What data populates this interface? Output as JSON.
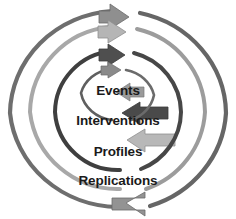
{
  "diagram": {
    "background_color": "#ffffff",
    "rings": [
      {
        "id": "events",
        "label": "Events",
        "level": 1,
        "position": "innermost",
        "arc_color": "#595959",
        "arrow_color": "#8c8c8c",
        "arrow_top_direction": "right",
        "arrow_bottom_direction": "left",
        "radius_x": 36,
        "radius_y": 33
      },
      {
        "id": "interventions",
        "label": "Interventions",
        "level": 2,
        "position": "second",
        "arc_color": "#404040",
        "arrow_color": "#595959",
        "arrow_top_direction": "right",
        "arrow_bottom_direction": "left",
        "radius_x": 63,
        "radius_y": 62
      },
      {
        "id": "profiles",
        "label": "Profiles",
        "level": 3,
        "position": "third",
        "arc_color": "#a6a6a6",
        "arrow_color": "#b3b3b3",
        "arrow_top_direction": "right",
        "arrow_bottom_direction": "left",
        "radius_x": 88,
        "radius_y": 87
      },
      {
        "id": "replications",
        "label": "Replications",
        "level": 4,
        "position": "outermost",
        "arc_color": "#737373",
        "arrow_color": "#8c8c8c",
        "arrow_top_direction": "right",
        "arrow_bottom_direction": "left",
        "radius_x": 110,
        "radius_y": 104
      }
    ],
    "colors": {
      "text": "#1a1a1a",
      "darkest_arc": "#404040",
      "lightest_arc": "#a6a6a6"
    }
  }
}
